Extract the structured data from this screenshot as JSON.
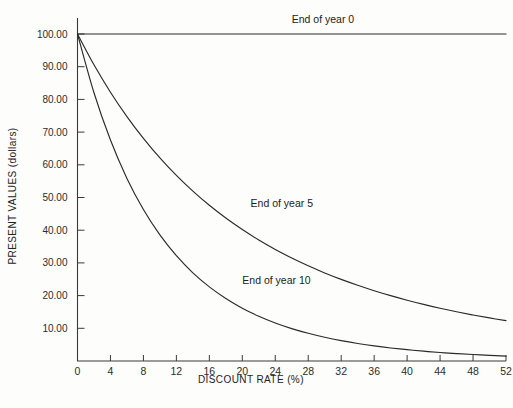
{
  "chart_data": {
    "type": "line",
    "title": "",
    "subtitle": "",
    "xlabel": "DISCOUNT RATE (%)",
    "ylabel": "PRESENT VALUES (dollars)",
    "xlim": [
      0,
      52
    ],
    "ylim": [
      0,
      103
    ],
    "grid": false,
    "legend_position": "inline-annotations",
    "x_tick_labels": [
      "0",
      "4",
      "8",
      "12",
      "16",
      "20",
      "24",
      "28",
      "32",
      "36",
      "40",
      "44",
      "48",
      "52"
    ],
    "x_ticks": [
      0,
      4,
      8,
      12,
      16,
      20,
      24,
      28,
      32,
      36,
      40,
      44,
      48,
      52
    ],
    "y_tick_labels": [
      "10.00",
      "20.00",
      "30.00",
      "40.00",
      "50.00",
      "60.00",
      "70.00",
      "80.00",
      "90.00",
      "100.00"
    ],
    "y_ticks": [
      10,
      20,
      30,
      40,
      50,
      60,
      70,
      80,
      90,
      100
    ],
    "series": [
      {
        "name": "End of year 0",
        "label": "End of year 0",
        "label_x": 26,
        "label_y": 103.5,
        "x": [
          0,
          4,
          8,
          12,
          16,
          20,
          24,
          28,
          32,
          36,
          40,
          44,
          48,
          52
        ],
        "values": [
          100,
          100,
          100,
          100,
          100,
          100,
          100,
          100,
          100,
          100,
          100,
          100,
          100,
          100
        ]
      },
      {
        "name": "End of year 5",
        "label": "End of year 5",
        "label_x": 21,
        "label_y": 47,
        "x": [
          0,
          2,
          4,
          6,
          8,
          10,
          12,
          14,
          16,
          18,
          20,
          22,
          24,
          26,
          28,
          30,
          32,
          34,
          36,
          38,
          40,
          42,
          44,
          46,
          48,
          50,
          52
        ],
        "values": [
          100.0,
          90.57,
          82.19,
          74.73,
          68.06,
          62.09,
          56.74,
          51.94,
          47.61,
          43.71,
          40.19,
          37.0,
          34.11,
          31.49,
          29.1,
          26.93,
          24.95,
          23.15,
          21.49,
          19.98,
          18.59,
          17.31,
          16.14,
          15.06,
          14.07,
          13.17,
          12.33
        ]
      },
      {
        "name": "End of year 10",
        "label": "End of year 10",
        "label_x": 20,
        "label_y": 23.5,
        "x": [
          0,
          2,
          4,
          6,
          8,
          10,
          12,
          14,
          16,
          18,
          20,
          22,
          24,
          26,
          28,
          30,
          32,
          34,
          36,
          38,
          40,
          42,
          44,
          46,
          48,
          50,
          52
        ],
        "values": [
          100.0,
          82.03,
          67.56,
          55.84,
          46.32,
          38.55,
          32.2,
          26.97,
          22.67,
          19.11,
          16.15,
          13.69,
          11.64,
          9.91,
          8.47,
          7.25,
          6.22,
          5.36,
          4.62,
          3.99,
          3.46,
          3.0,
          2.6,
          2.27,
          1.98,
          1.73,
          1.51
        ]
      }
    ]
  },
  "axes": {
    "x_axis_title": "DISCOUNT RATE (%)",
    "y_axis_title": "PRESENT VALUES (dollars)"
  }
}
